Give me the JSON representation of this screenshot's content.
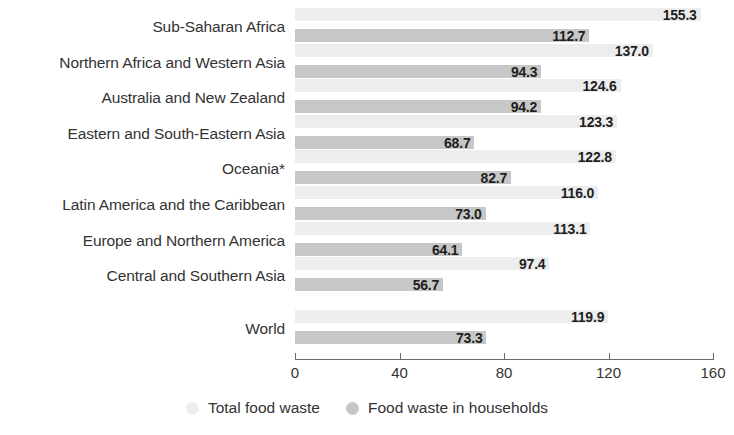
{
  "chart_data": {
    "type": "bar",
    "orientation": "horizontal",
    "title": "",
    "xlabel": "",
    "ylabel": "",
    "xlim": [
      0,
      160
    ],
    "xticks": [
      "0",
      "40",
      "80",
      "120",
      "160"
    ],
    "grid": false,
    "legend_position": "bottom-center",
    "categories": [
      "Sub-Saharan Africa",
      "Northern Africa and Western Asia",
      "Australia and New Zealand",
      "Eastern and South-Eastern Asia",
      "Oceania*",
      "Latin America and the Caribbean",
      "Europe and Northern America",
      "Central and Southern Asia",
      "World"
    ],
    "series": [
      {
        "name": "Total food waste",
        "color": "#ededed",
        "values": [
          155.3,
          137.0,
          124.6,
          123.3,
          122.8,
          116.0,
          113.1,
          97.4,
          119.9
        ],
        "labels": [
          "155.3",
          "137.0",
          "124.6",
          "123.3",
          "122.8",
          "116.0",
          "113.1",
          "97.4",
          "119.9"
        ]
      },
      {
        "name": "Food waste in households",
        "color": "#c7c7c7",
        "values": [
          112.7,
          94.3,
          94.2,
          68.7,
          82.7,
          73.0,
          64.1,
          56.7,
          73.3
        ],
        "labels": [
          "112.7",
          "94.3",
          "94.2",
          "68.7",
          "82.7",
          "73.0",
          "64.1",
          "56.7",
          "73.3"
        ]
      }
    ]
  },
  "legend": {
    "items": [
      {
        "label": "Total food waste",
        "color": "#ededed"
      },
      {
        "label": "Food waste in households",
        "color": "#c7c7c7"
      }
    ]
  }
}
